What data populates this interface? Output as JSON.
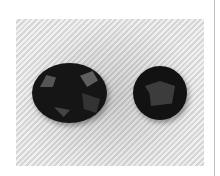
{
  "image": {
    "description": "Photograph of two dark faceted gemstones (one oval, one round) on a diagonally striped light gray fabric background",
    "subjects": [
      {
        "name": "oval-gemstone",
        "shape": "oval",
        "color": "#151515"
      },
      {
        "name": "round-gemstone",
        "shape": "round",
        "color": "#121212"
      }
    ],
    "background_color": "#dcdcdc",
    "stripe_light": "#eeeeee",
    "stripe_dark": "#cfcfcf",
    "page_background": "#ffffff",
    "divider_color": "#bdbdbd"
  }
}
